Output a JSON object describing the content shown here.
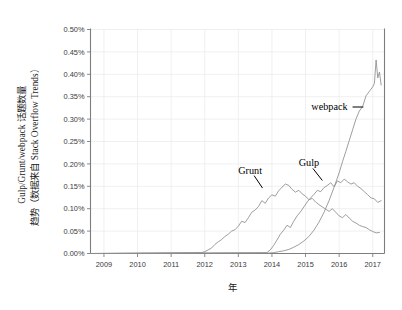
{
  "chart_data": {
    "type": "line",
    "title": "",
    "xlabel": "年",
    "ylabel_line1": "Gulp/Grunt/webpack 话题数量",
    "ylabel_line2": "趋势（数据来自 Stack Overflow Trends）",
    "xlim": [
      2008.6,
      2017.35
    ],
    "ylim": [
      0.0,
      0.5
    ],
    "ytick_labels": [
      "0.00%",
      "0.05%",
      "0.10%",
      "0.15%",
      "0.20%",
      "0.25%",
      "0.30%",
      "0.35%",
      "0.40%",
      "0.45%",
      "0.50%"
    ],
    "ytick_values": [
      0.0,
      0.05,
      0.1,
      0.15,
      0.2,
      0.25,
      0.3,
      0.35,
      0.4,
      0.45,
      0.5
    ],
    "xtick_labels": [
      "2009",
      "2010",
      "2011",
      "2012",
      "2013",
      "2014",
      "2015",
      "2016",
      "2017"
    ],
    "xtick_values": [
      2009,
      2010,
      2011,
      2012,
      2013,
      2014,
      2015,
      2016,
      2017
    ],
    "grid": true,
    "legend_position": "inline-annotations",
    "unit": "percent",
    "line_color": "#8d8d8d",
    "grid_color": "#e9e9e9",
    "axis_color": "#7d7d7d",
    "annotations": [
      {
        "label": "webpack",
        "x": 2016.25,
        "y": 0.327,
        "point_x": 2016.72,
        "point_y": 0.327
      },
      {
        "label": "Grunt",
        "x": 2013.35,
        "y": 0.185,
        "point_x": 2013.72,
        "point_y": 0.146
      },
      {
        "label": "Gulp",
        "x": 2015.1,
        "y": 0.201,
        "point_x": 2015.5,
        "point_y": 0.163
      }
    ],
    "series": [
      {
        "name": "Grunt",
        "x": [
          2011.9,
          2012.0,
          2012.1,
          2012.2,
          2012.3,
          2012.4,
          2012.5,
          2012.6,
          2012.7,
          2012.8,
          2012.9,
          2013.0,
          2013.1,
          2013.2,
          2013.3,
          2013.4,
          2013.5,
          2013.6,
          2013.7,
          2013.8,
          2013.9,
          2014.0,
          2014.1,
          2014.2,
          2014.3,
          2014.4,
          2014.5,
          2014.6,
          2014.7,
          2014.8,
          2014.9,
          2015.0,
          2015.1,
          2015.2,
          2015.3,
          2015.4,
          2015.5,
          2015.6,
          2015.7,
          2015.8,
          2015.9,
          2016.0,
          2016.1,
          2016.2,
          2016.3,
          2016.4,
          2016.5,
          2016.6,
          2016.7,
          2016.8,
          2016.9,
          2017.0,
          2017.1,
          2017.2
        ],
        "values": [
          0.002,
          0.004,
          0.008,
          0.012,
          0.02,
          0.026,
          0.031,
          0.038,
          0.043,
          0.05,
          0.053,
          0.061,
          0.072,
          0.069,
          0.08,
          0.092,
          0.097,
          0.105,
          0.118,
          0.112,
          0.124,
          0.131,
          0.128,
          0.14,
          0.148,
          0.155,
          0.152,
          0.143,
          0.137,
          0.141,
          0.133,
          0.128,
          0.12,
          0.123,
          0.115,
          0.109,
          0.104,
          0.099,
          0.094,
          0.1,
          0.092,
          0.084,
          0.08,
          0.087,
          0.079,
          0.072,
          0.068,
          0.063,
          0.06,
          0.058,
          0.053,
          0.049,
          0.046,
          0.047
        ]
      },
      {
        "name": "Gulp",
        "x": [
          2013.85,
          2013.95,
          2014.05,
          2014.15,
          2014.25,
          2014.35,
          2014.45,
          2014.55,
          2014.65,
          2014.75,
          2014.85,
          2014.95,
          2015.05,
          2015.15,
          2015.25,
          2015.35,
          2015.45,
          2015.55,
          2015.65,
          2015.75,
          2015.85,
          2015.95,
          2016.05,
          2016.15,
          2016.25,
          2016.35,
          2016.45,
          2016.55,
          2016.65,
          2016.75,
          2016.85,
          2016.95,
          2017.05,
          2017.15,
          2017.25
        ],
        "values": [
          0.002,
          0.008,
          0.018,
          0.03,
          0.043,
          0.052,
          0.063,
          0.058,
          0.072,
          0.084,
          0.093,
          0.104,
          0.115,
          0.124,
          0.132,
          0.141,
          0.138,
          0.147,
          0.152,
          0.158,
          0.149,
          0.162,
          0.158,
          0.166,
          0.16,
          0.155,
          0.158,
          0.15,
          0.145,
          0.138,
          0.131,
          0.124,
          0.122,
          0.114,
          0.118
        ]
      },
      {
        "name": "webpack",
        "x": [
          2013.9,
          2014.05,
          2014.2,
          2014.35,
          2014.5,
          2014.65,
          2014.8,
          2014.95,
          2015.1,
          2015.25,
          2015.4,
          2015.55,
          2015.7,
          2015.85,
          2016.0,
          2016.1,
          2016.2,
          2016.3,
          2016.4,
          2016.5,
          2016.6,
          2016.7,
          2016.8,
          2016.9,
          2017.0,
          2017.05,
          2017.1,
          2017.15,
          2017.2,
          2017.25
        ],
        "values": [
          0.001,
          0.002,
          0.004,
          0.006,
          0.009,
          0.014,
          0.02,
          0.028,
          0.038,
          0.052,
          0.07,
          0.092,
          0.118,
          0.148,
          0.18,
          0.205,
          0.228,
          0.252,
          0.276,
          0.3,
          0.318,
          0.328,
          0.352,
          0.362,
          0.372,
          0.38,
          0.432,
          0.392,
          0.405,
          0.376
        ]
      }
    ]
  }
}
